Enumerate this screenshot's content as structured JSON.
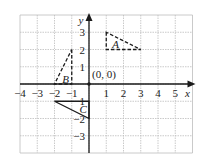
{
  "figure": {
    "type": "coordinate-grid",
    "x_range": [
      -4,
      6
    ],
    "y_range": [
      -4,
      4
    ],
    "x_axis_label": "x",
    "y_axis_label": "y",
    "x_tick_labels": [
      "−4",
      "−3",
      "−2",
      "−1",
      "1",
      "2",
      "3",
      "4",
      "5"
    ],
    "y_tick_labels": [
      "3",
      "2",
      "1",
      "−1",
      "−2",
      "−3"
    ],
    "origin_label": "(0, 0)"
  },
  "shapes": [
    {
      "label": "A",
      "style": "dashed",
      "vertices": [
        [
          1,
          3
        ],
        [
          1,
          2
        ],
        [
          3,
          2
        ]
      ]
    },
    {
      "label": "B",
      "style": "dashed",
      "vertices": [
        [
          -1,
          2
        ],
        [
          -1,
          0
        ],
        [
          -2,
          0
        ]
      ]
    },
    {
      "label": "C",
      "style": "solid",
      "vertices": [
        [
          0,
          -1
        ],
        [
          0,
          -2
        ],
        [
          -2,
          -1
        ]
      ]
    }
  ],
  "colors": {
    "grid": "#bdbdbd",
    "axis": "#1a1a1a",
    "shape": "#1a1a1a"
  }
}
